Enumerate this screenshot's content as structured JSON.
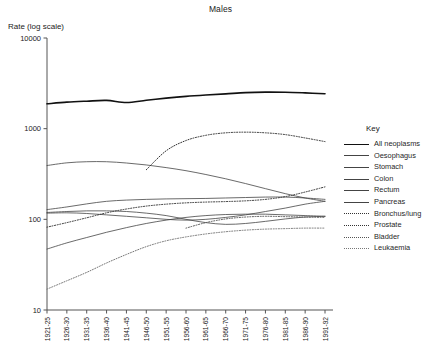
{
  "chart_data": {
    "type": "line",
    "title": "Males",
    "ylabel": "Rate (log scale)",
    "xlabel": "",
    "scale": "log",
    "grid": false,
    "legend_position": "right",
    "legend_title": "Key",
    "ylim": [
      10,
      10000
    ],
    "ytick_labels": [
      "10000",
      "1000",
      "100",
      "10"
    ],
    "ytick_values": [
      10000,
      1000,
      100,
      10
    ],
    "categories": [
      "1921-25",
      "1926-30",
      "1931-35",
      "1936-40",
      "1941-45",
      "1946-50",
      "1951-55",
      "1956-60",
      "1961-65",
      "1966-70",
      "1971-75",
      "1976-80",
      "1981-85",
      "1986-90",
      "1991-92"
    ],
    "series": [
      {
        "name": "All neoplasms",
        "style": "solid",
        "width": 1.6,
        "color": "#111111",
        "values": [
          1880,
          1960,
          2010,
          2050,
          1940,
          2060,
          2170,
          2270,
          2350,
          2420,
          2500,
          2530,
          2520,
          2480,
          2430
        ]
      },
      {
        "name": "Oesophagus",
        "style": "solid",
        "width": 0.8,
        "color": "#444444",
        "values": [
          117,
          118,
          116,
          112,
          108,
          104,
          100,
          98,
          100,
          105,
          112,
          122,
          133,
          147,
          158
        ]
      },
      {
        "name": "Stomach",
        "style": "solid",
        "width": 0.8,
        "color": "#444444",
        "values": [
          392,
          420,
          432,
          432,
          418,
          398,
          372,
          344,
          312,
          280,
          248,
          218,
          192,
          172,
          158
        ]
      },
      {
        "name": "Colon",
        "style": "solid",
        "width": 0.8,
        "color": "#444444",
        "values": [
          128,
          137,
          148,
          158,
          163,
          166,
          168,
          169,
          170,
          172,
          174,
          176,
          176,
          172,
          166
        ]
      },
      {
        "name": "Rectum",
        "style": "solid",
        "width": 0.8,
        "color": "#444444",
        "values": [
          119,
          122,
          124,
          124,
          122,
          117,
          110,
          100,
          92,
          88,
          90,
          95,
          101,
          106,
          108
        ]
      },
      {
        "name": "Pancreas",
        "style": "solid",
        "width": 0.8,
        "color": "#444444",
        "values": [
          47,
          55,
          63,
          72,
          81,
          90,
          98,
          105,
          110,
          113,
          114,
          114,
          112,
          110,
          108
        ]
      },
      {
        "name": "Bronchus/lung",
        "style": "dotted",
        "width": 1.0,
        "color": "#333333",
        "values": [
          null,
          null,
          null,
          null,
          null,
          352,
          570,
          740,
          845,
          900,
          915,
          900,
          860,
          790,
          720
        ]
      },
      {
        "name": "Prostate",
        "style": "dotted",
        "width": 1.0,
        "color": "#333333",
        "values": [
          82,
          92,
          104,
          118,
          130,
          140,
          147,
          152,
          155,
          157,
          160,
          166,
          178,
          200,
          228
        ]
      },
      {
        "name": "Bladder",
        "style": "dotted",
        "width": 1.0,
        "color": "#555555",
        "values": [
          null,
          null,
          null,
          null,
          null,
          null,
          null,
          80,
          92,
          101,
          106,
          108,
          107,
          106,
          105
        ]
      },
      {
        "name": "Leukaemia",
        "style": "dotted",
        "width": 1.0,
        "color": "#777777",
        "values": [
          17,
          21,
          26,
          33,
          41,
          50,
          58,
          64,
          69,
          73,
          76,
          78,
          79,
          80,
          80
        ]
      }
    ]
  }
}
